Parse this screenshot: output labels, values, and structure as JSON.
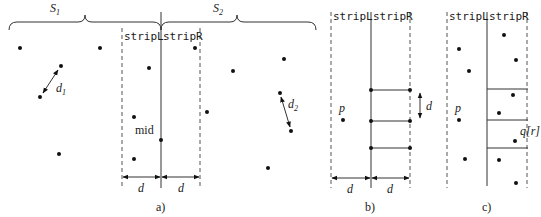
{
  "panels": {
    "a": {
      "caption": "a)",
      "set_left_label": "S",
      "set_left_sub": "1",
      "set_right_label": "S",
      "set_right_sub": "2",
      "strip_left_label": "stripL",
      "strip_right_label": "stripR",
      "mid_label": "mid",
      "width_label_left": "d",
      "width_label_right": "d",
      "pair_left_label": "d",
      "pair_left_sub": "1",
      "pair_right_label": "d",
      "pair_right_sub": "2",
      "points": [
        [
          20,
          48
        ],
        [
          100,
          48
        ],
        [
          61,
          66
        ],
        [
          40,
          97
        ],
        [
          59,
          154
        ],
        [
          149,
          68
        ],
        [
          134,
          117
        ],
        [
          134,
          159
        ],
        [
          161,
          140
        ],
        [
          195,
          48
        ],
        [
          233,
          71
        ],
        [
          284,
          59
        ],
        [
          207,
          112
        ],
        [
          280,
          93
        ],
        [
          291,
          131
        ],
        [
          268,
          168
        ]
      ]
    },
    "b": {
      "caption": "b)",
      "strip_left_label": "stripL",
      "strip_right_label": "stripR",
      "point_label": "p",
      "height_label": "d",
      "width_label_left": "d",
      "width_label_right": "d"
    },
    "c": {
      "caption": "c)",
      "strip_left_label": "stripL",
      "strip_right_label": "stripR",
      "point_label": "p",
      "query_label": "q[r]",
      "points": [
        [
          459,
          49
        ],
        [
          469,
          71
        ],
        [
          459,
          120
        ],
        [
          465,
          159
        ],
        [
          504,
          35
        ],
        [
          516,
          60
        ],
        [
          513,
          95
        ],
        [
          499,
          113
        ],
        [
          515,
          141
        ],
        [
          499,
          160
        ],
        [
          516,
          183
        ]
      ]
    }
  }
}
